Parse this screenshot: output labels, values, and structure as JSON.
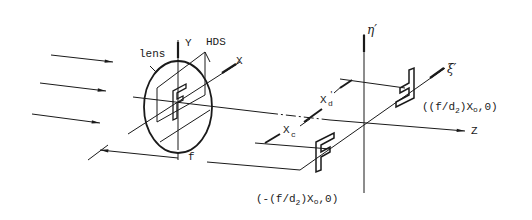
{
  "figure": {
    "stroke_color": "#1a1a1a",
    "background": "#ffffff"
  },
  "labels": {
    "lens": "lens",
    "y_axis": "Y",
    "hds": "HDS",
    "x_axis": "X",
    "focal_length": "f",
    "eta_prime": "η′",
    "xi_prime": "ξ′",
    "z_axis": "Z",
    "xd_prime": "X′d",
    "xd_main": "X",
    "xd_sub": "d",
    "xc_main": "X",
    "xc_sub": "c",
    "pos_point_prefix": "((f/d",
    "pos_point_sub": "2",
    "pos_point_suffix": ")X",
    "pos_point_sub2": "o",
    "pos_point_end": ",0)",
    "neg_point_prefix": "(-(f/d",
    "neg_point_sub": "2",
    "neg_point_suffix": ")X",
    "neg_point_sub2": "o",
    "neg_point_end": ",0)"
  },
  "elements": {
    "incident_rays": 3,
    "object_glyph": "F",
    "image_glyphs": [
      "F (upright, lower-left)",
      "F (inverted, upper-right)"
    ]
  }
}
